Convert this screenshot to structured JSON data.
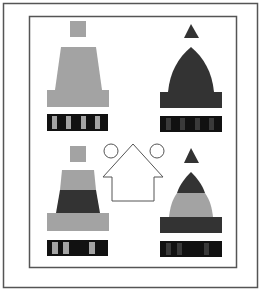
{
  "figure": {
    "colors": {
      "background": "#ffffff",
      "frame": "#555555",
      "light_gray": "#a3a3a3",
      "dark_gray": "#333333",
      "black": "#111111",
      "outline": "#555555"
    },
    "panels": [
      {
        "id": "top-left",
        "top_marker": "square",
        "body_shape": "trapezoid",
        "bands": [
          "light"
        ],
        "code_bar": [
          "black",
          "light",
          "black",
          "light",
          "black",
          "light",
          "black",
          "light",
          "black"
        ]
      },
      {
        "id": "top-right",
        "top_marker": "triangle",
        "body_shape": "dome",
        "bands": [
          "dark"
        ],
        "code_bar": [
          "black",
          "dark",
          "black",
          "dark",
          "black",
          "dark",
          "black",
          "dark",
          "black"
        ]
      },
      {
        "id": "bottom-left",
        "top_marker": "square",
        "body_shape": "trapezoid",
        "bands": [
          "light",
          "dark",
          "light"
        ],
        "code_bar": [
          "black",
          "light",
          "black",
          "light",
          "black",
          "light",
          "black"
        ]
      },
      {
        "id": "bottom-right",
        "top_marker": "triangle",
        "body_shape": "dome",
        "bands": [
          "dark",
          "light",
          "dark"
        ],
        "code_bar": [
          "black",
          "dark",
          "black",
          "dark",
          "black",
          "dark",
          "black"
        ]
      }
    ],
    "center": {
      "shape": "house-outline",
      "circles": 2
    }
  }
}
